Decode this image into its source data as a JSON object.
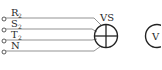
{
  "diagram": {
    "terminals": [
      {
        "label": "R",
        "sub": "2"
      },
      {
        "label": "S",
        "sub": "2"
      },
      {
        "label": "T",
        "sub": "2"
      },
      {
        "label": "N",
        "sub": ""
      }
    ],
    "switch": {
      "label": "VS",
      "symbol": "voltmeter-selector-switch"
    },
    "meter": {
      "label": "V",
      "symbol": "voltmeter"
    },
    "colors": {
      "line": "#333333",
      "wire": "#666666",
      "background": "#ffffff"
    }
  }
}
